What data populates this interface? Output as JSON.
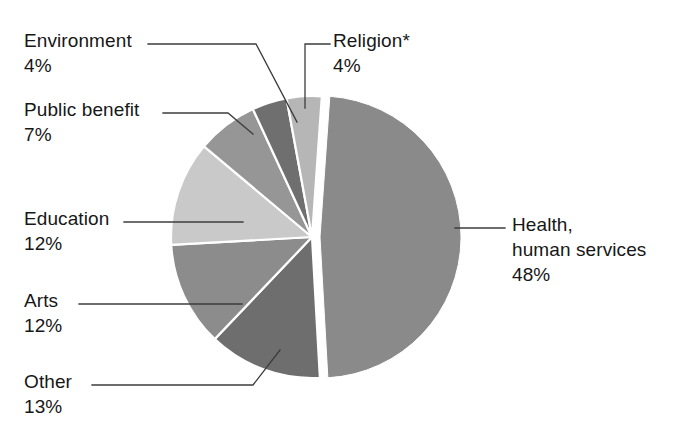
{
  "chart_data": {
    "type": "pie",
    "title": "",
    "subtitle": "",
    "xlabel": "",
    "ylabel": "",
    "legend_position": "callout-labels",
    "grid": false,
    "units": "percent",
    "categories": [
      "Health, human services",
      "Other",
      "Arts",
      "Education",
      "Public benefit",
      "Environment",
      "Religion*"
    ],
    "values": [
      48,
      13,
      12,
      12,
      7,
      4,
      4
    ],
    "slices": [
      {
        "id": "health",
        "label_line1": "Health,",
        "label_line2": "human services",
        "value": 48,
        "percent_text": "48%",
        "color": "#8a8a8a",
        "exploded": true
      },
      {
        "id": "other",
        "label_line1": "Other",
        "label_line2": "",
        "value": 13,
        "percent_text": "13%",
        "color": "#6e6e6e",
        "exploded": false
      },
      {
        "id": "arts",
        "label_line1": "Arts",
        "label_line2": "",
        "value": 12,
        "percent_text": "12%",
        "color": "#8c8c8c",
        "exploded": false
      },
      {
        "id": "education",
        "label_line1": "Education",
        "label_line2": "",
        "value": 12,
        "percent_text": "12%",
        "color": "#c9c9c9",
        "exploded": false
      },
      {
        "id": "public",
        "label_line1": "Public benefit",
        "label_line2": "",
        "value": 7,
        "percent_text": "7%",
        "color": "#969696",
        "exploded": false
      },
      {
        "id": "environment",
        "label_line1": "Environment",
        "label_line2": "",
        "value": 4,
        "percent_text": "4%",
        "color": "#6f6f6f",
        "exploded": false
      },
      {
        "id": "religion",
        "label_line1": "Religion*",
        "label_line2": "",
        "value": 4,
        "percent_text": "4%",
        "color": "#b6b6b6",
        "exploded": false
      }
    ]
  },
  "labels": {
    "environment": {
      "name": "Environment",
      "pct": "4%"
    },
    "public": {
      "name": "Public benefit",
      "pct": "7%"
    },
    "education": {
      "name": "Education",
      "pct": "12%"
    },
    "arts": {
      "name": "Arts",
      "pct": "12%"
    },
    "other": {
      "name": "Other",
      "pct": "13%"
    },
    "religion": {
      "name": "Religion*",
      "pct": "4%"
    },
    "health": {
      "name": "Health,",
      "name2": "human services",
      "pct": "48%"
    }
  },
  "style": {
    "background": "#ffffff",
    "text_color": "#171717",
    "leader_line_color": "#3c3c3c",
    "slice_gap_color": "#ffffff"
  }
}
